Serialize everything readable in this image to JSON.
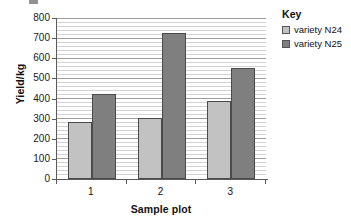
{
  "chart_data": {
    "type": "bar",
    "title": "",
    "xlabel": "Sample plot",
    "ylabel": "Yield/kg",
    "categories": [
      "1",
      "2",
      "3"
    ],
    "series": [
      {
        "name": "variety N24",
        "values": [
          285,
          303,
          389
        ],
        "color": "#c2c2c2"
      },
      {
        "name": "variety N25",
        "values": [
          422,
          726,
          551
        ],
        "color": "#7f7f7f"
      }
    ],
    "ylim": [
      0,
      800
    ],
    "ytick_step": 100,
    "yticks": [
      "800",
      "700",
      "600",
      "500",
      "400",
      "300",
      "200",
      "100",
      "0"
    ],
    "grid": "horizontal-minor-and-major",
    "minor_grid_step": 20,
    "legend_position": "right"
  },
  "legend": {
    "title": "Key",
    "entries": [
      {
        "label": "variety N24",
        "color": "#c2c2c2"
      },
      {
        "label": "variety N25",
        "color": "#7f7f7f"
      }
    ]
  },
  "axes": {
    "y_label": "Yield/kg",
    "x_label": "Sample plot"
  }
}
